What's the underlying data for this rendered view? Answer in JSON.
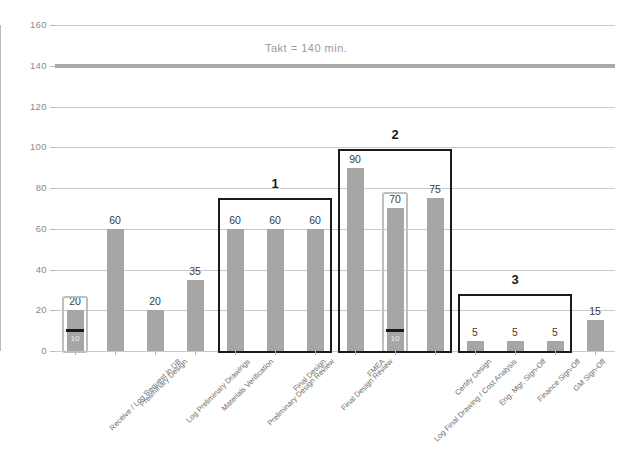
{
  "chart_data": {
    "type": "bar",
    "title": "",
    "xlabel": "",
    "ylabel": "",
    "ylim": [
      0,
      160
    ],
    "yticks": [
      0,
      20,
      40,
      60,
      80,
      100,
      120,
      140,
      160
    ],
    "grid": true,
    "legend": "none",
    "categories": [
      "Receive / Log Request in DB",
      "Preliminary Design",
      "Log Preliminary Drawings",
      "Materials Verification",
      "Preliminary Design Review",
      "Final Design",
      "Final Design Review",
      "FMEA",
      "Log Final Drawing / Cost Analysis",
      "Certify Design",
      "Eng. Mgr. Sign-Off",
      "Finance Sign-Off",
      "GM Sign-Off",
      "Upload to Operations DB"
    ],
    "values": [
      20,
      60,
      20,
      35,
      60,
      60,
      60,
      90,
      70,
      75,
      5,
      5,
      5,
      15
    ],
    "value_labels": [
      "20",
      "60",
      "20",
      "35",
      "60",
      "60",
      "60",
      "90",
      "70",
      "75",
      "5",
      "5",
      "5",
      "15"
    ],
    "bar_color": "#a6a6a6",
    "reference_line": {
      "value": 140,
      "label": "Takt = 140 min.",
      "color": "#a9a9a9"
    },
    "value_add_markers": [
      {
        "category_index": 0,
        "value": 10,
        "label": "10",
        "box_top": 27
      },
      {
        "category_index": 8,
        "value": 10,
        "label": "10",
        "box_top": 78
      }
    ],
    "annotation_groups": [
      {
        "label": "1",
        "from_index": 4,
        "to_index": 6,
        "box_top_value": 75
      },
      {
        "label": "2",
        "from_index": 7,
        "to_index": 9,
        "box_top_value": 99
      },
      {
        "label": "3",
        "from_index": 10,
        "to_index": 12,
        "box_top_value": 28
      }
    ]
  },
  "caption": ""
}
